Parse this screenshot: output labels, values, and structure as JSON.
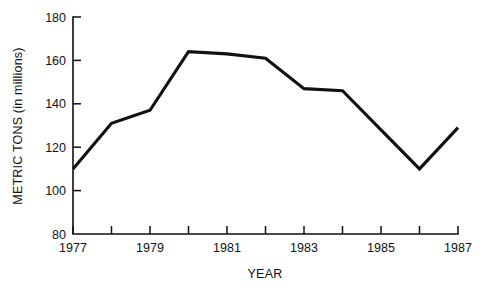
{
  "chart_data": {
    "type": "line",
    "title": "",
    "xlabel": "YEAR",
    "ylabel": "METRIC TONS (in millions)",
    "x": [
      1977,
      1978,
      1979,
      1980,
      1981,
      1982,
      1983,
      1984,
      1985,
      1986,
      1987
    ],
    "values": [
      110,
      131,
      137,
      164,
      163,
      161,
      147,
      146,
      128,
      110,
      129
    ],
    "series": [
      {
        "name": "Metric tons",
        "values": [
          110,
          131,
          137,
          164,
          163,
          161,
          147,
          146,
          128,
          110,
          129
        ]
      }
    ],
    "xlim": [
      1977,
      1987
    ],
    "ylim": [
      80,
      180
    ],
    "y_ticks": [
      80,
      100,
      120,
      140,
      160,
      180
    ],
    "y_tick_labels": [
      "80",
      "100",
      "120",
      "140",
      "160",
      "180"
    ],
    "x_ticks": [
      1977,
      1978,
      1979,
      1980,
      1981,
      1982,
      1983,
      1984,
      1985,
      1986,
      1987
    ],
    "x_tick_labels": [
      "1977",
      "",
      "1979",
      "",
      "1981",
      "",
      "1983",
      "",
      "1985",
      "",
      "1987"
    ],
    "grid": false,
    "legend": "none",
    "line_color": "#111111",
    "background_color": "#ffffff"
  },
  "axes": {
    "y_axis_title": "METRIC TONS (in millions)",
    "x_axis_title": "YEAR"
  }
}
